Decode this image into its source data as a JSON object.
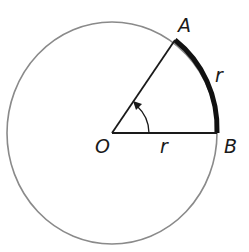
{
  "diagram": {
    "points": {
      "center": {
        "label": "O"
      },
      "a": {
        "label": "A"
      },
      "b": {
        "label": "B"
      }
    },
    "labels": {
      "arc_length": "r",
      "radius": "r"
    },
    "colors": {
      "circle": "#8a8a8a",
      "lines": "#1a1a1a",
      "arc": "#111111"
    }
  }
}
